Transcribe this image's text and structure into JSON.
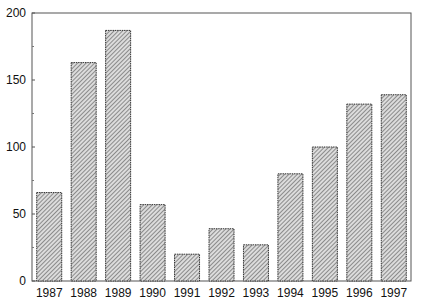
{
  "chart_data": {
    "type": "bar",
    "title": "",
    "xlabel": "",
    "ylabel": "",
    "categories": [
      "1987",
      "1988",
      "1989",
      "1990",
      "1991",
      "1992",
      "1993",
      "1994",
      "1995",
      "1996",
      "1997"
    ],
    "values": [
      66,
      163,
      187,
      57,
      20,
      39,
      27,
      80,
      100,
      132,
      139
    ],
    "ylim": [
      0,
      200
    ],
    "yticks": [
      0,
      50,
      100,
      150,
      200
    ],
    "yminor_ticks": [
      25,
      75,
      125,
      175
    ],
    "grid": false,
    "legend": null,
    "bar_fill": "hatched-grey",
    "colors": {
      "bar_hatch": "#555555",
      "bar_bg": "#d8d8d8",
      "bar_edge": "#333333",
      "axis": "#444444"
    }
  }
}
